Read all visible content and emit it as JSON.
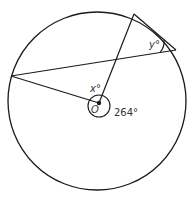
{
  "diagram": {
    "type": "circle-geometry",
    "center_label": "O",
    "angle_x_label": "x°",
    "angle_y_label": "y°",
    "reflex_angle_label": "264°",
    "reflex_angle_value": 264,
    "colors": {
      "stroke": "#1a1a1a",
      "text": "#333333",
      "background": "#ffffff"
    }
  }
}
